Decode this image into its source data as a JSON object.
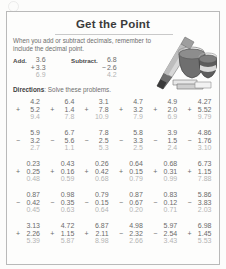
{
  "worksheet": {
    "title": "Get the Point",
    "intro": "When you add or subtract decimals, remember to include the decimal point.",
    "directions_label": "Directions",
    "directions_text": ": Solve these problems.",
    "colors": {
      "ink": "#6b6b6b",
      "title": "#3b3b3b",
      "answer": "#b4b4b4",
      "rule": "#9a9a9a",
      "frame": "#b9b9b9",
      "paper": "#fdfdfc"
    },
    "examples": [
      {
        "label": "Add.",
        "top": "3.6",
        "operator": "+",
        "bottom": "3.3",
        "answer": "6.9"
      },
      {
        "label": "Subtract.",
        "top": "6.8",
        "operator": "−",
        "bottom": "2.6",
        "answer": "4.2"
      }
    ],
    "clipart_name": "pencil-inkwell-books-illustration"
  },
  "problems": [
    [
      {
        "top": "4.2",
        "operator": "+",
        "bottom": "5.2",
        "answer": "9.4"
      },
      {
        "top": "6.4",
        "operator": "+",
        "bottom": "1.4",
        "answer": "7.8"
      },
      {
        "top": "3.1",
        "operator": "+",
        "bottom": "7.8",
        "answer": "10.9"
      },
      {
        "top": "4.7",
        "operator": "+",
        "bottom": "3.2",
        "answer": "7.9"
      },
      {
        "top": "4.9",
        "operator": "+",
        "bottom": "2.0",
        "answer": "6.9"
      },
      {
        "top": "4.27",
        "operator": "+",
        "bottom": "5.52",
        "answer": "9.79"
      }
    ],
    [
      {
        "top": "5.9",
        "operator": "−",
        "bottom": "3.2",
        "answer": "2.7"
      },
      {
        "top": "6.7",
        "operator": "−",
        "bottom": "5.6",
        "answer": "1.1"
      },
      {
        "top": "7.8",
        "operator": "−",
        "bottom": "2.5",
        "answer": "5.3"
      },
      {
        "top": "5.8",
        "operator": "−",
        "bottom": "3.3",
        "answer": "2.5"
      },
      {
        "top": "3.9",
        "operator": "−",
        "bottom": "1.5",
        "answer": "2.4"
      },
      {
        "top": "4.86",
        "operator": "−",
        "bottom": "1.76",
        "answer": "3.10"
      }
    ],
    [
      {
        "top": "0.23",
        "operator": "+",
        "bottom": "0.25",
        "answer": "0.48"
      },
      {
        "top": "0.43",
        "operator": "+",
        "bottom": "0.16",
        "answer": "0.59"
      },
      {
        "top": "0.26",
        "operator": "+",
        "bottom": "0.42",
        "answer": "0.68"
      },
      {
        "top": "0.64",
        "operator": "+",
        "bottom": "0.15",
        "answer": "0.79"
      },
      {
        "top": "0.68",
        "operator": "+",
        "bottom": "0.31",
        "answer": "0.99"
      },
      {
        "top": "6.73",
        "operator": "+",
        "bottom": "1.15",
        "answer": "7.88"
      }
    ],
    [
      {
        "top": "0.87",
        "operator": "−",
        "bottom": "0.42",
        "answer": "0.45"
      },
      {
        "top": "0.98",
        "operator": "−",
        "bottom": "0.35",
        "answer": "0.63"
      },
      {
        "top": "0.79",
        "operator": "−",
        "bottom": "0.15",
        "answer": "0.64"
      },
      {
        "top": "0.87",
        "operator": "−",
        "bottom": "0.67",
        "answer": "0.20"
      },
      {
        "top": "0.83",
        "operator": "−",
        "bottom": "0.12",
        "answer": "0.71"
      },
      {
        "top": "5.86",
        "operator": "−",
        "bottom": "3.83",
        "answer": "2.03"
      }
    ],
    [
      {
        "top": "3.13",
        "operator": "+",
        "bottom": "2.26",
        "answer": "5.39"
      },
      {
        "top": "4.72",
        "operator": "+",
        "bottom": "1.15",
        "answer": "5.87"
      },
      {
        "top": "6.87",
        "operator": "+",
        "bottom": "2.11",
        "answer": "8.98"
      },
      {
        "top": "4.98",
        "operator": "−",
        "bottom": "2.32",
        "answer": "2.66"
      },
      {
        "top": "5.97",
        "operator": "−",
        "bottom": "2.54",
        "answer": "3.43"
      },
      {
        "top": "6.98",
        "operator": "+",
        "bottom": "1.45",
        "answer": "5.53"
      }
    ]
  ]
}
